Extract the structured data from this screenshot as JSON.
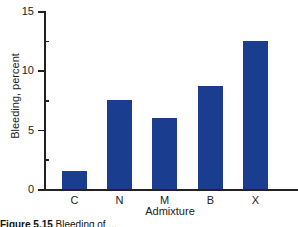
{
  "chart_data": {
    "type": "bar",
    "title": "",
    "xlabel": "Admixture",
    "ylabel": "Bleeding, percent",
    "categories": [
      "C",
      "N",
      "M",
      "B",
      "X"
    ],
    "values": [
      1.5,
      7.5,
      6.0,
      8.7,
      12.5
    ],
    "ylim": [
      0,
      15
    ],
    "yticks": [
      0,
      5,
      10,
      15
    ],
    "minor_yticks": [
      2.5,
      7.5,
      12.5
    ],
    "grid": false,
    "legend": null,
    "bar_color": "#1a3d8f"
  },
  "caption": {
    "label": "Figure 5.15",
    "text": "Bleeding of ..."
  }
}
